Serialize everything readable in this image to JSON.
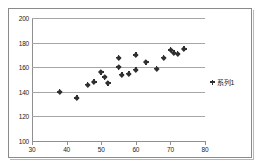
{
  "chart_data": {
    "type": "scatter",
    "title": "",
    "xlabel": "",
    "ylabel": "",
    "xlim": [
      30,
      80
    ],
    "ylim": [
      100,
      200
    ],
    "xticks": [
      30,
      40,
      50,
      60,
      70,
      80
    ],
    "yticks": [
      100,
      120,
      140,
      160,
      180,
      200
    ],
    "grid": true,
    "legend_position": "right",
    "series": [
      {
        "name": "系列1",
        "marker": "diamond-plus",
        "color": "#2f2f2f",
        "points": [
          [
            38,
            140
          ],
          [
            43,
            135
          ],
          [
            46,
            146
          ],
          [
            48,
            148
          ],
          [
            50,
            156
          ],
          [
            51,
            152
          ],
          [
            52,
            147
          ],
          [
            55,
            168
          ],
          [
            55,
            160
          ],
          [
            56,
            154
          ],
          [
            58,
            155
          ],
          [
            60,
            170
          ],
          [
            60,
            158
          ],
          [
            63,
            164
          ],
          [
            66,
            159
          ],
          [
            68,
            168
          ],
          [
            70,
            174
          ],
          [
            71,
            172
          ],
          [
            72,
            171
          ],
          [
            74,
            175
          ]
        ]
      }
    ]
  },
  "legend": {
    "entries": [
      {
        "label": "系列1",
        "marker_name": "series-1-marker"
      }
    ]
  },
  "axes": {
    "y_tick_labels": [
      "200",
      "180",
      "160",
      "140",
      "120",
      "100"
    ],
    "x_tick_labels": [
      "30",
      "40",
      "50",
      "60",
      "70",
      "80"
    ]
  }
}
